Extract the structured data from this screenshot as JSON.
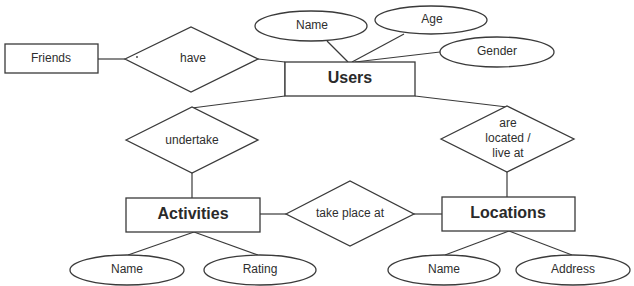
{
  "diagram": {
    "type": "entity-relationship",
    "entities": {
      "friends": "Friends",
      "users": "Users",
      "activities": "Activities",
      "locations": "Locations"
    },
    "relationships": {
      "have": "have",
      "undertake": "undertake",
      "take_place_at": "take place at",
      "located_line1": "are",
      "located_line2": "located /",
      "located_line3": "live at"
    },
    "attributes": {
      "users_name": "Name",
      "users_age": "Age",
      "users_gender": "Gender",
      "activities_name": "Name",
      "activities_rating": "Rating",
      "locations_name": "Name",
      "locations_address": "Address"
    },
    "edges": [
      [
        "Friends",
        "have"
      ],
      [
        "have",
        "Users"
      ],
      [
        "Users",
        "Name"
      ],
      [
        "Users",
        "Age"
      ],
      [
        "Users",
        "Gender"
      ],
      [
        "Users",
        "undertake"
      ],
      [
        "Users",
        "are located / live at"
      ],
      [
        "undertake",
        "Activities"
      ],
      [
        "are located / live at",
        "Locations"
      ],
      [
        "Activities",
        "take place at"
      ],
      [
        "take place at",
        "Locations"
      ],
      [
        "Activities",
        "Name"
      ],
      [
        "Activities",
        "Rating"
      ],
      [
        "Locations",
        "Name"
      ],
      [
        "Locations",
        "Address"
      ]
    ]
  }
}
